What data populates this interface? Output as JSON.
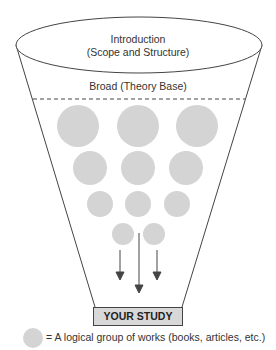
{
  "top": {
    "line1": "Introduction",
    "line2": "(Scope and Structure)"
  },
  "broad_label": "Broad (Theory Base)",
  "target_label": "YOUR STUDY",
  "legend_text": "= A logical group of works (books, articles, etc.)",
  "colors": {
    "circle": "#d4d4d4",
    "line": "#444444",
    "box": "#d8d8d8"
  }
}
